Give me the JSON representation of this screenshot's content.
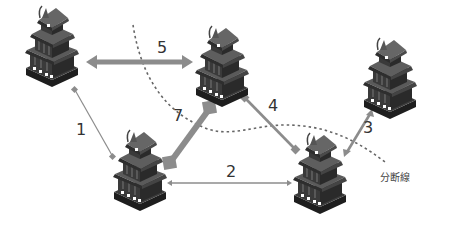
{
  "diagram": {
    "type": "network-partition",
    "colors": {
      "arrow": "#8c8c8c",
      "dashed_line": "#666666",
      "castle_roof": "#5a5a5a",
      "castle_wall": "#3a3a3a",
      "castle_base": "#222222",
      "label": "#333333"
    },
    "nodes": [
      {
        "id": "A",
        "icon": "castle-icon",
        "x": 52,
        "y": 48
      },
      {
        "id": "B",
        "icon": "castle-icon",
        "x": 222,
        "y": 68
      },
      {
        "id": "C",
        "icon": "castle-icon",
        "x": 390,
        "y": 80
      },
      {
        "id": "D",
        "icon": "castle-icon",
        "x": 140,
        "y": 172
      },
      {
        "id": "E",
        "icon": "castle-icon",
        "x": 320,
        "y": 175
      }
    ],
    "edges": [
      {
        "label": "1",
        "from": "A",
        "to": "D",
        "weight": "thin"
      },
      {
        "label": "2",
        "from": "D",
        "to": "E",
        "weight": "thin"
      },
      {
        "label": "3",
        "from": "C",
        "to": "E",
        "weight": "medium"
      },
      {
        "label": "4",
        "from": "B",
        "to": "E",
        "weight": "medium"
      },
      {
        "label": "5",
        "from": "A",
        "to": "B",
        "weight": "thick"
      },
      {
        "label": "7",
        "from": "D",
        "to": "B",
        "weight": "very-thick"
      }
    ],
    "split_line_label": "分断線"
  }
}
